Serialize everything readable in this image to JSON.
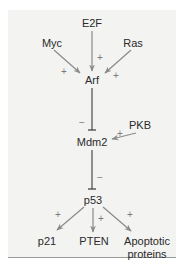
{
  "diagram": {
    "colors": {
      "panel_background": "#f3f3f2",
      "activation_arrow": "#8a8a8a",
      "inhibition_line": "#3a3a3a",
      "text": "#2a2a2a",
      "sign": "#7a7a7a"
    },
    "nodes": {
      "e2f": "E2F",
      "myc": "Myc",
      "ras": "Ras",
      "arf": "Arf",
      "pkb": "PKB",
      "mdm2": "Mdm2",
      "p53": "p53",
      "p21": "p21",
      "pten": "PTEN",
      "apoptotic_line1": "Apoptotic",
      "apoptotic_line2": "proteins"
    },
    "edges": [
      {
        "from": "E2F",
        "to": "Arf",
        "type": "activation",
        "sign": "+"
      },
      {
        "from": "Myc",
        "to": "Arf",
        "type": "activation",
        "sign": "+"
      },
      {
        "from": "Ras",
        "to": "Arf",
        "type": "activation",
        "sign": "+"
      },
      {
        "from": "Arf",
        "to": "Mdm2",
        "type": "inhibition",
        "sign": "−"
      },
      {
        "from": "PKB",
        "to": "Mdm2",
        "type": "activation",
        "sign": "+"
      },
      {
        "from": "Mdm2",
        "to": "p53",
        "type": "inhibition",
        "sign": "−"
      },
      {
        "from": "p53",
        "to": "p21",
        "type": "activation",
        "sign": "+"
      },
      {
        "from": "p53",
        "to": "PTEN",
        "type": "activation",
        "sign": "+"
      },
      {
        "from": "p53",
        "to": "Apoptotic proteins",
        "type": "activation",
        "sign": "+"
      }
    ],
    "signs": {
      "plus": "+",
      "minus": "−"
    }
  }
}
